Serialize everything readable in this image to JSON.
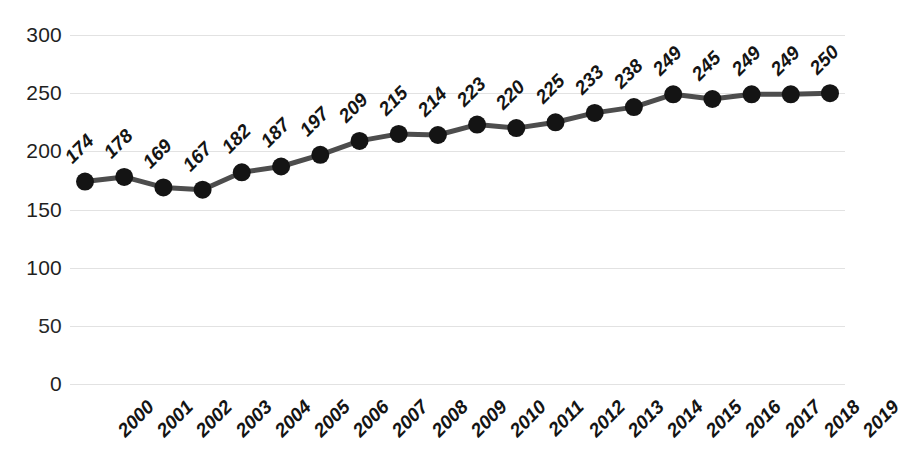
{
  "chart_data": {
    "type": "line",
    "title": "",
    "subtitle": "",
    "xlabel": "",
    "ylabel": "",
    "categories": [
      "2000",
      "2001",
      "2002",
      "2003",
      "2004",
      "2005",
      "2006",
      "2007",
      "2008",
      "2009",
      "2010",
      "2011",
      "2012",
      "2013",
      "2014",
      "2015",
      "2016",
      "2017",
      "2018",
      "2019"
    ],
    "values": [
      174,
      178,
      169,
      167,
      182,
      187,
      197,
      209,
      215,
      214,
      223,
      220,
      225,
      233,
      238,
      249,
      245,
      249,
      249,
      250
    ],
    "data_labels": [
      "174",
      "178",
      "169",
      "167",
      "182",
      "187",
      "197",
      "209",
      "215",
      "214",
      "223",
      "220",
      "225",
      "233",
      "238",
      "249",
      "245",
      "249",
      "249",
      "250"
    ],
    "ylim": [
      0,
      300
    ],
    "ytick_values": [
      300,
      250,
      200,
      150,
      100,
      50,
      0
    ],
    "ytick_labels": [
      "300",
      "250",
      "200",
      "150",
      "100",
      "50",
      "0"
    ],
    "ytick_step": 50,
    "grid": true,
    "grid_axis": "y",
    "legend": false,
    "legend_position": "none",
    "series": [
      {
        "name": "",
        "values": [
          174,
          178,
          169,
          167,
          182,
          187,
          197,
          209,
          215,
          214,
          223,
          220,
          225,
          233,
          238,
          249,
          245,
          249,
          249,
          250
        ],
        "line_color": "#4d4d4d",
        "marker_color": "#141414",
        "marker": "circle"
      }
    ],
    "colors": {
      "line": "#4d4d4d",
      "marker": "#141414",
      "gridline": "#e2e2e2",
      "text": "#1a1a1a",
      "background": "#ffffff"
    }
  }
}
